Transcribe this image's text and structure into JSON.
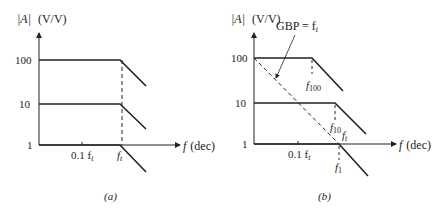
{
  "panel_a": {
    "y_label_abs": "|A|",
    "y_label_unit": "(V/V)",
    "y_ticks": [
      "100",
      "10",
      "1"
    ],
    "x_label_f": "f",
    "x_label_unit": "(dec)",
    "x_tick_1": "0.1 f",
    "x_tick_1_sub": "t",
    "x_tick_2": "f",
    "x_tick_2_sub": "t",
    "caption": "(a)"
  },
  "panel_b": {
    "y_label_abs": "|A|",
    "y_label_unit": "(V/V)",
    "y_ticks": [
      "100",
      "10",
      "1"
    ],
    "x_label_f": "f",
    "x_label_unit": "(dec)",
    "x_tick_1": "0.1 f",
    "x_tick_1_sub": "t",
    "annotation_gbp": "GBP = f",
    "annotation_gbp_sub": "t",
    "f100": "f",
    "f100_sub": "100",
    "f10": "f",
    "f10_sub": "10",
    "ft": "f",
    "ft_sub": "t",
    "f1": "f",
    "f1_sub": "1",
    "caption": "(b)"
  },
  "colors": {
    "line": "#222222",
    "background": "#ffffff"
  }
}
